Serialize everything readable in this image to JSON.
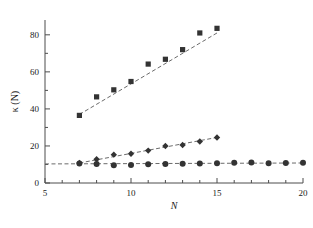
{
  "chart_data": {
    "type": "scatter",
    "title": "",
    "xlabel": "N",
    "ylabel": "κ (N)",
    "xlim": [
      5,
      20
    ],
    "ylim": [
      0,
      88
    ],
    "grid": false,
    "legend_position": "none",
    "x_ticks_major": [
      5,
      10,
      15,
      20
    ],
    "x_tick_labels": [
      "5",
      "10",
      "15",
      "20"
    ],
    "x_ticks_minor": [
      6,
      7,
      8,
      9,
      11,
      12,
      13,
      14,
      16,
      17,
      18,
      19
    ],
    "y_ticks_major": [
      0,
      20,
      40,
      60,
      80
    ],
    "y_tick_labels": [
      "0",
      "20",
      "40",
      "60",
      "80"
    ],
    "y_ticks_minor": [
      10,
      30,
      50,
      70
    ],
    "series": [
      {
        "name": "squares",
        "marker": "square",
        "color": "#333333",
        "x": [
          7,
          8,
          9,
          10,
          11,
          12,
          13,
          14,
          15
        ],
        "values": [
          36.5,
          46.5,
          50.3,
          54.8,
          64.2,
          66.8,
          72.0,
          81.0,
          83.5
        ],
        "trend_line": {
          "style": "dashed",
          "x": [
            7,
            15
          ],
          "y": [
            37.0,
            81.0
          ]
        }
      },
      {
        "name": "diamonds",
        "marker": "diamond",
        "color": "#333333",
        "x": [
          7,
          8,
          9,
          10,
          11,
          12,
          13,
          14,
          15
        ],
        "values": [
          10.8,
          12.8,
          15.3,
          15.8,
          17.5,
          20.0,
          20.5,
          22.4,
          24.6
        ],
        "trend_line": {
          "style": "dashed",
          "x": [
            7,
            15
          ],
          "y": [
            10.8,
            24.6
          ]
        }
      },
      {
        "name": "circles",
        "marker": "circle",
        "color": "#333333",
        "x": [
          7,
          8,
          9,
          10,
          11,
          12,
          13,
          14,
          15,
          16,
          17,
          18,
          19,
          20
        ],
        "values": [
          10.5,
          10.3,
          9.6,
          9.7,
          10.1,
          10.3,
          10.4,
          10.5,
          10.6,
          11.0,
          11.1,
          10.7,
          10.8,
          10.9
        ],
        "trend_line": {
          "style": "dashed",
          "x": [
            5,
            20
          ],
          "y": [
            10.3,
            10.8
          ]
        }
      }
    ]
  },
  "colors": {
    "marker": "#333333",
    "axis": "#4d4d4d",
    "trend": "#6b6b6b",
    "background": "#ffffff"
  }
}
